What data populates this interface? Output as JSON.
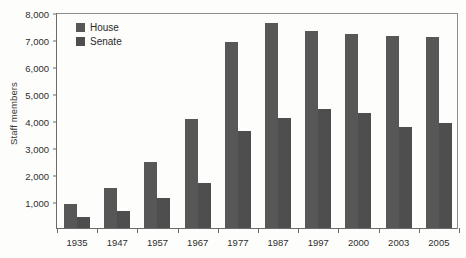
{
  "chart_data": {
    "type": "bar",
    "title": "",
    "xlabel": "",
    "ylabel": "Staff members",
    "ylim": [
      0,
      8000
    ],
    "ytick_labels": [
      "8,000",
      "7,000",
      "6,000",
      "5,000",
      "4,000",
      "3,000",
      "2,000",
      "1,000"
    ],
    "ytick_values": [
      8000,
      7000,
      6000,
      5000,
      4000,
      3000,
      2000,
      1000
    ],
    "grid": false,
    "legend_position": "top-left",
    "categories": [
      "1935",
      "1947",
      "1957",
      "1967",
      "1977",
      "1987",
      "1997",
      "2000",
      "2003",
      "2005"
    ],
    "series": [
      {
        "name": "House",
        "color": "#575757",
        "values": [
          900,
          1500,
          2440,
          4050,
          6890,
          7580,
          7280,
          7190,
          7110,
          7080
        ]
      },
      {
        "name": "Senate",
        "color": "#4e4e4e",
        "values": [
          420,
          620,
          1120,
          1660,
          3600,
          4070,
          4400,
          4250,
          3740,
          3900
        ]
      }
    ]
  }
}
